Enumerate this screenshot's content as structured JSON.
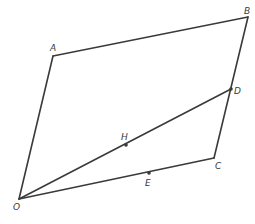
{
  "diagram": {
    "type": "geometry",
    "stroke_color": "#3a3a3a",
    "points": {
      "O": {
        "label": "O",
        "x": 19,
        "y": 199,
        "label_x": 13,
        "label_y": 210,
        "dot": false
      },
      "A": {
        "label": "A",
        "x": 53,
        "y": 56,
        "label_x": 50,
        "label_y": 51,
        "dot": false
      },
      "B": {
        "label": "B",
        "x": 248,
        "y": 17,
        "label_x": 244,
        "label_y": 14,
        "dot": false
      },
      "C": {
        "label": "C",
        "x": 214,
        "y": 158,
        "label_x": 215,
        "label_y": 169,
        "dot": false
      },
      "D": {
        "label": "D",
        "x": 231,
        "y": 89,
        "label_x": 234,
        "label_y": 94,
        "dot": true
      },
      "H": {
        "label": "H",
        "x": 126,
        "y": 145,
        "label_x": 121,
        "label_y": 140,
        "dot": true
      },
      "E": {
        "label": "E",
        "x": 149,
        "y": 173,
        "label_x": 145,
        "label_y": 186,
        "dot": true
      }
    },
    "segments": [
      {
        "from": "O",
        "to": "A"
      },
      {
        "from": "A",
        "to": "B"
      },
      {
        "from": "B",
        "to": "C"
      },
      {
        "from": "C",
        "to": "O"
      },
      {
        "from": "O",
        "to": "D"
      }
    ]
  }
}
